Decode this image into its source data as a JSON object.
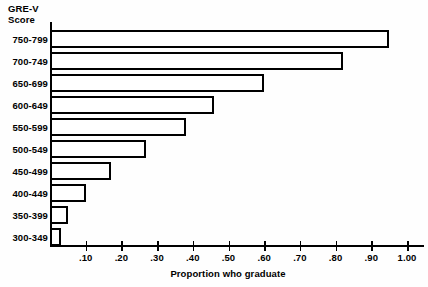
{
  "chart_data": {
    "type": "bar",
    "orientation": "horizontal",
    "title": "",
    "xlabel": "Proportion who graduate",
    "ylabel": "GRE-V Score",
    "ylabel_lines": [
      "GRE-V",
      "Score"
    ],
    "categories": [
      "750-799",
      "700-749",
      "650-699",
      "600-649",
      "550-599",
      "500-549",
      "450-499",
      "400-449",
      "350-399",
      "300-349"
    ],
    "values": [
      0.95,
      0.82,
      0.6,
      0.46,
      0.38,
      0.27,
      0.17,
      0.1,
      0.05,
      0.03
    ],
    "xlim": [
      0.0,
      1.05
    ],
    "xticks": [
      0.1,
      0.2,
      0.3,
      0.4,
      0.5,
      0.6,
      0.7,
      0.8,
      0.9,
      1.0
    ],
    "xtick_labels": [
      ".10",
      ".20",
      ".30",
      ".40",
      ".50",
      ".60",
      ".70",
      ".80",
      ".90",
      "1.00"
    ],
    "grid": false,
    "legend": false,
    "bar_fill": "#ffffff",
    "bar_edge": "#000000",
    "background": "#fefefe"
  }
}
